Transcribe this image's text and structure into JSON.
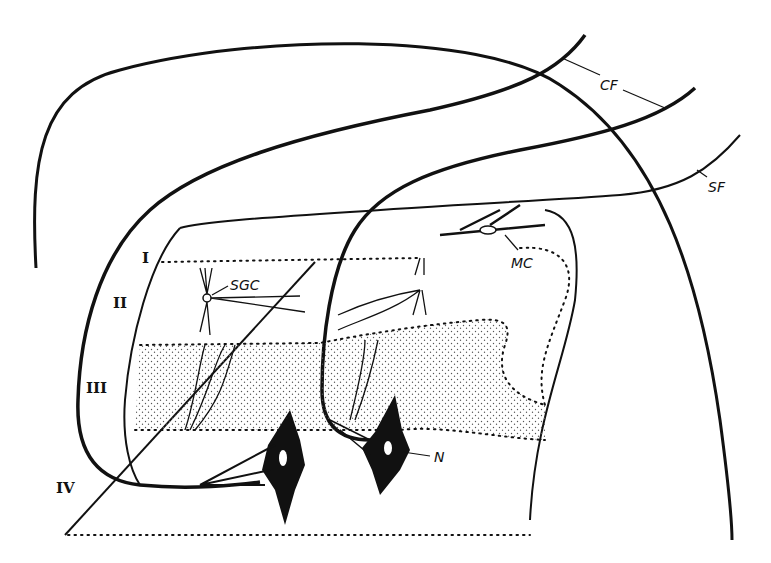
{
  "figure": {
    "type": "anatomical-diagram",
    "ink_color": "#111111",
    "background": "#ffffff",
    "stipple_color": "#555555"
  },
  "labels": {
    "layers": [
      {
        "id": "layer-1",
        "text": "I"
      },
      {
        "id": "layer-2",
        "text": "II"
      },
      {
        "id": "layer-3",
        "text": "III"
      },
      {
        "id": "layer-4",
        "text": "IV"
      }
    ],
    "structures": [
      {
        "id": "cf",
        "text": "CF"
      },
      {
        "id": "sf",
        "text": "SF"
      },
      {
        "id": "sgc",
        "text": "SGC"
      },
      {
        "id": "mc",
        "text": "MC"
      },
      {
        "id": "n",
        "text": "N"
      }
    ]
  }
}
